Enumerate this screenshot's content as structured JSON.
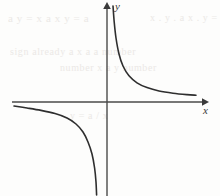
{
  "figure": {
    "background_color": "#fdfdfc",
    "ink_color": "#3a3a3a",
    "ghost_text_color": "#e9e6e3"
  },
  "axes": {
    "x_label": "x",
    "y_label": "y",
    "x_axis_name": "horizontal-axis",
    "y_axis_name": "vertical-axis",
    "origin": {
      "x": 107,
      "y": 102
    },
    "x_axis_start": {
      "x": 12,
      "y": 102
    },
    "x_axis_end": {
      "x": 205,
      "y": 102
    },
    "y_axis_start": {
      "x": 107,
      "y": 196
    },
    "y_axis_end": {
      "x": 107,
      "y": 6
    },
    "x_arrow_icon": "arrow-right-icon",
    "y_arrow_icon": "arrow-up-icon"
  },
  "ghost_text": {
    "lines": [
      {
        "text": "a y = x  a  x  y = a",
        "x": 8,
        "y": 12,
        "size": 11
      },
      {
        "text": "x . y . a    x . y = a",
        "x": 150,
        "y": 12,
        "size": 10
      },
      {
        "text": "sign already  a  x  a  a number",
        "x": 10,
        "y": 46,
        "size": 10
      },
      {
        "text": "number  x  a  y  number",
        "x": 60,
        "y": 62,
        "size": 10
      },
      {
        "text": "y = a / x",
        "x": 70,
        "y": 110,
        "size": 10
      }
    ]
  },
  "chart_data": {
    "type": "line",
    "xlabel": "x",
    "ylabel": "y",
    "grid": false,
    "legend": "none",
    "xlim": [
      -4.75,
      4.9
    ],
    "ylim": [
      -4.7,
      4.8
    ],
    "asymptotes": {
      "vertical": 0,
      "horizontal": 0
    },
    "series": [
      {
        "name": "upper-right-branch",
        "quadrant": "I",
        "points": [
          {
            "x": 0.3,
            "y": 4.8
          },
          {
            "x": 0.36,
            "y": 4.0
          },
          {
            "x": 0.45,
            "y": 3.2
          },
          {
            "x": 0.6,
            "y": 2.4
          },
          {
            "x": 0.8,
            "y": 1.8
          },
          {
            "x": 1.1,
            "y": 1.31
          },
          {
            "x": 1.5,
            "y": 0.96
          },
          {
            "x": 2.0,
            "y": 0.72
          },
          {
            "x": 2.6,
            "y": 0.55
          },
          {
            "x": 3.3,
            "y": 0.44
          },
          {
            "x": 4.0,
            "y": 0.37
          },
          {
            "x": 4.45,
            "y": 0.34
          }
        ]
      },
      {
        "name": "lower-left-branch",
        "quadrant": "III",
        "points": [
          {
            "x": -4.65,
            "y": -0.2
          },
          {
            "x": -4.0,
            "y": -0.3
          },
          {
            "x": -3.3,
            "y": -0.42
          },
          {
            "x": -2.6,
            "y": -0.58
          },
          {
            "x": -2.0,
            "y": -0.8
          },
          {
            "x": -1.55,
            "y": -1.1
          },
          {
            "x": -1.2,
            "y": -1.5
          },
          {
            "x": -0.95,
            "y": -2.0
          },
          {
            "x": -0.75,
            "y": -2.6
          },
          {
            "x": -0.62,
            "y": -3.3
          },
          {
            "x": -0.55,
            "y": -4.0
          },
          {
            "x": -0.52,
            "y": -4.65
          }
        ]
      }
    ]
  }
}
